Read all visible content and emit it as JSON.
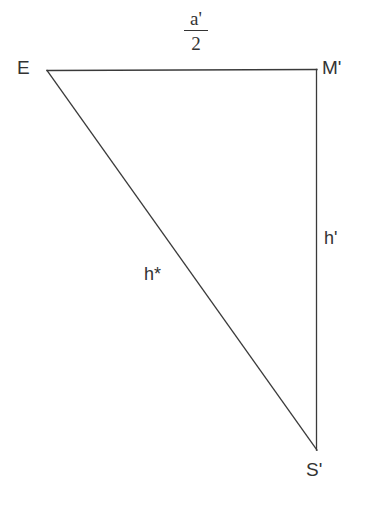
{
  "figure": {
    "type": "geometry-diagram",
    "shape": "right-triangle",
    "background_color": "#ffffff",
    "stroke_color": "#3a3a3a",
    "text_color": "#333333",
    "stroke_width": 1.3,
    "width": 368,
    "height": 508
  },
  "vertices": [
    {
      "name": "E",
      "label": "E",
      "x": 47,
      "y": 70,
      "label_x": 17,
      "label_y": 58
    },
    {
      "name": "M'",
      "label": "M'",
      "x": 317,
      "y": 70,
      "label_x": 322,
      "label_y": 58
    },
    {
      "name": "S'",
      "label": "S'",
      "x": 317,
      "y": 450,
      "label_x": 306,
      "label_y": 460
    }
  ],
  "edges": [
    {
      "name": "top-edge",
      "from": "E",
      "to": "M'",
      "label": "a'/2",
      "label_kind": "fraction"
    },
    {
      "name": "right-edge",
      "from": "M'",
      "to": "S'",
      "label": "h'",
      "label_kind": "plain"
    },
    {
      "name": "hypotenuse-edge",
      "from": "E",
      "to": "S'",
      "label": "h*",
      "label_kind": "plain"
    }
  ],
  "labels": {
    "vertex_E": "E",
    "vertex_M_prime": "M'",
    "vertex_S_prime": "S'",
    "side_h_prime": "h'",
    "side_h_star": "h*",
    "fraction_numerator": "a'",
    "fraction_denominator": "2"
  }
}
